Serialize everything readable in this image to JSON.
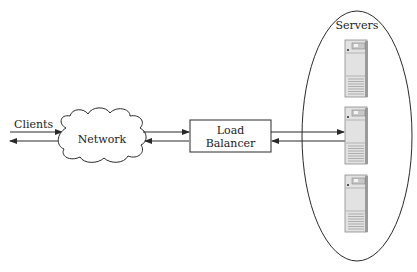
{
  "diagram": {
    "clients_label": "Clients",
    "network_label": "Network",
    "load_balancer_label_line1": "Load",
    "load_balancer_label_line2": "Balancer",
    "servers_label": "Servers",
    "servers_count": 3,
    "icons": {
      "network": "cloud-icon",
      "server": "server-tower-icon"
    },
    "colors": {
      "line": "#2a2a2a",
      "server_body": "#e4e4e4",
      "server_edge": "#8a8a8a"
    }
  }
}
